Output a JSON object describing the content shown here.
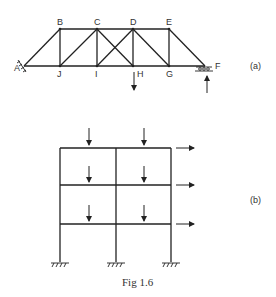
{
  "figure": {
    "caption": "Fig 1.6",
    "parts": [
      {
        "id": "a",
        "label": "(a)",
        "type": "truss",
        "nodes": {
          "A": "A",
          "B": "B",
          "C": "C",
          "D": "D",
          "E": "E",
          "F": "F",
          "G": "G",
          "H": "H",
          "I": "I",
          "J": "J"
        },
        "supports": [
          "pinned at A",
          "roller at F"
        ],
        "loads": [
          "downward load at H",
          "upward reaction at F"
        ]
      },
      {
        "id": "b",
        "label": "(b)",
        "type": "frame",
        "bays": 2,
        "storeys": 3,
        "supports": [
          "fixed",
          "fixed",
          "fixed"
        ],
        "loads": [
          "vertical loads at mid-span of each beam",
          "horizontal loads at each floor level"
        ]
      }
    ]
  }
}
